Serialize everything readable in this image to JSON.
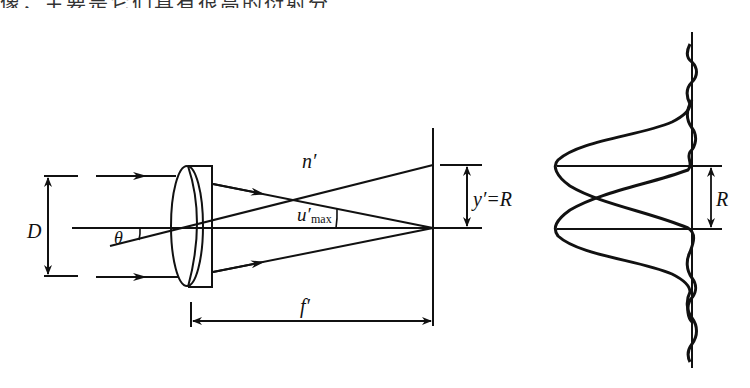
{
  "header": {
    "partial_caption": "像，主要是它们具有很高的衍射分辨率。"
  },
  "diagram": {
    "left_figure": {
      "aperture_label": "D",
      "field_angle_label": "θ",
      "image_space_index_label": "n′",
      "aperture_angle_label": "u′",
      "aperture_angle_subscript": "max",
      "image_height_label": "y′=R",
      "focal_length_label": "f′"
    },
    "right_figure": {
      "separation_label": "R",
      "description": "Two overlapping Airy diffraction intensity profiles separated by R"
    },
    "colors": {
      "line": "#111111",
      "background": "#ffffff"
    }
  }
}
